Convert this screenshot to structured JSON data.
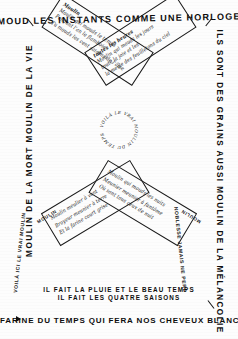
{
  "document": {
    "title": "Calligramme du Moulin",
    "ink_color": "#111111",
    "paper_color": "#fdfdfd"
  },
  "top": {
    "line": "MOUD LES INSTANTS COMME UNE HORLOGE"
  },
  "left_edge": {
    "line": "MOULIN DE LA MORT MOULIN DE LA VIE"
  },
  "right_edge": {
    "line": "ILS SONT DES GRAINS AUSSI MOULIN DE LA MÉLANCOLIE"
  },
  "blades": {
    "upper_left": {
      "name": "Moulin",
      "lines": [
        "Moulin qui mouds le temps",
        "Pendant l'an le flamboie",
        "Tu mouds les cent saisons de l'âme"
      ]
    },
    "upper_right": {
      "name": "Moulin",
      "lines": [
        "Moulin qui mouds les jours",
        "toutes les heures",
        "toute la joie et les",
        "la meule des feuilletons du ciel"
      ]
    },
    "lower_left": {
      "name": "Moulin",
      "lines": [
        "Moulin meulier à vent",
        "Broyeur meunier à terre",
        "Et la farine court grise"
      ],
      "label": "MOULIN"
    },
    "lower_right": {
      "name": "Moulin",
      "lines": [
        "Moulin qui mouds les nuits",
        "Meunier meunier à fantôme",
        "Où sont tous ceux de nuit"
      ],
      "label": "MOULIN"
    }
  },
  "hub": {
    "ring_text": "VOILÀ LE VRAI MOULIN DU TEMPS QUI TOURNE ET TOURNE"
  },
  "diagonals": {
    "left": "VOILÀ ICI LE VRAI MOULIN",
    "right": "NOBLESSE JAMAIS NE PERD"
  },
  "bottom": {
    "line1": "IL FAIT  LA PLUIE ET LE BEAU TEMPS",
    "line2": "IL FAIT  LES   QUATRE SAISONS",
    "final": "FARINE DU TEMPS QUI FERA NOS CHEVEUX BLANCS"
  },
  "marks": {
    "arrow": "arrow-marker",
    "tick_top_left": "tick-mark",
    "tick_top_right": "tick-mark",
    "tick_bottom_right": "tick-mark"
  }
}
